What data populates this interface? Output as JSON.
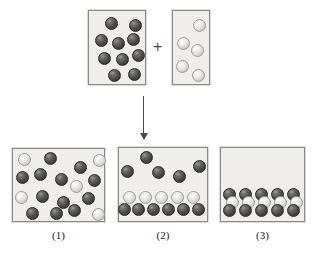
{
  "diagram": {
    "operator": "+",
    "arrow": "down-arrow",
    "colors": {
      "dark_sphere": "#4d4d4b",
      "light_sphere": "#dcdcd8",
      "box_fill": "#efeeec",
      "box_border": "#8a8a88",
      "ink": "#4a4a48"
    }
  },
  "reactants": [
    {
      "id": "reactant-box-a",
      "name": "dark-particle-container",
      "x": 88,
      "y": 10,
      "w": 58,
      "h": 75,
      "dark_count": 10,
      "light_count": 0,
      "spheres": [
        {
          "type": "dark",
          "x": 16,
          "y": 6
        },
        {
          "type": "dark",
          "x": 40,
          "y": 8
        },
        {
          "type": "dark",
          "x": 6,
          "y": 23
        },
        {
          "type": "dark",
          "x": 23,
          "y": 26
        },
        {
          "type": "dark",
          "x": 38,
          "y": 22
        },
        {
          "type": "dark",
          "x": 9,
          "y": 41
        },
        {
          "type": "dark",
          "x": 27,
          "y": 42
        },
        {
          "type": "dark",
          "x": 43,
          "y": 38
        },
        {
          "type": "dark",
          "x": 19,
          "y": 58
        },
        {
          "type": "dark",
          "x": 39,
          "y": 57
        }
      ]
    },
    {
      "id": "reactant-box-b",
      "name": "light-particle-container",
      "x": 172,
      "y": 10,
      "w": 38,
      "h": 75,
      "dark_count": 0,
      "light_count": 5,
      "spheres": [
        {
          "type": "light",
          "x": 20,
          "y": 8
        },
        {
          "type": "light",
          "x": 4,
          "y": 26
        },
        {
          "type": "light",
          "x": 18,
          "y": 33
        },
        {
          "type": "light",
          "x": 3,
          "y": 49
        },
        {
          "type": "light",
          "x": 19,
          "y": 58
        }
      ]
    }
  ],
  "products": [
    {
      "id": "product-box-1",
      "name": "product-container-1",
      "label": "(1)",
      "description": "Dark and light particles randomly mixed throughout the container",
      "x": 12,
      "y": 148,
      "w": 93,
      "h": 74,
      "dark_count": 13,
      "light_count": 5,
      "spheres": [
        {
          "type": "light",
          "x": 5,
          "y": 4
        },
        {
          "type": "dark",
          "x": 31,
          "y": 3
        },
        {
          "type": "dark",
          "x": 61,
          "y": 12
        },
        {
          "type": "light",
          "x": 80,
          "y": 5
        },
        {
          "type": "dark",
          "x": 3,
          "y": 22
        },
        {
          "type": "dark",
          "x": 21,
          "y": 19
        },
        {
          "type": "dark",
          "x": 42,
          "y": 24
        },
        {
          "type": "light",
          "x": 57,
          "y": 31
        },
        {
          "type": "dark",
          "x": 75,
          "y": 25
        },
        {
          "type": "light",
          "x": 2,
          "y": 42
        },
        {
          "type": "dark",
          "x": 23,
          "y": 41
        },
        {
          "type": "dark",
          "x": 44,
          "y": 47
        },
        {
          "type": "dark",
          "x": 69,
          "y": 43
        },
        {
          "type": "dark",
          "x": 13,
          "y": 58
        },
        {
          "type": "dark",
          "x": 37,
          "y": 58
        },
        {
          "type": "dark",
          "x": 55,
          "y": 55
        },
        {
          "type": "light",
          "x": 79,
          "y": 59
        }
      ]
    },
    {
      "id": "product-box-2",
      "name": "product-container-2",
      "label": "(2)",
      "description": "Dark particles above a settled bilayer of light over dark particles",
      "x": 118,
      "y": 147,
      "w": 90,
      "h": 75,
      "dark_count": 11,
      "light_count": 5,
      "top_scatter": [
        {
          "type": "dark",
          "x": 21,
          "y": 3
        },
        {
          "type": "dark",
          "x": 2,
          "y": 17
        },
        {
          "type": "dark",
          "x": 33,
          "y": 18
        },
        {
          "type": "dark",
          "x": 54,
          "y": 22
        },
        {
          "type": "dark",
          "x": 74,
          "y": 12
        }
      ],
      "settled_light_row": [
        {
          "type": "light",
          "x": 4,
          "y": 43
        },
        {
          "type": "light",
          "x": 20,
          "y": 43
        },
        {
          "type": "light",
          "x": 36,
          "y": 43
        },
        {
          "type": "light",
          "x": 52,
          "y": 43
        },
        {
          "type": "light",
          "x": 68,
          "y": 43
        }
      ],
      "settled_dark_row": [
        {
          "type": "dark",
          "x": -1,
          "y": 55
        },
        {
          "type": "dark",
          "x": 13,
          "y": 55
        },
        {
          "type": "dark",
          "x": 28,
          "y": 55
        },
        {
          "type": "dark",
          "x": 43,
          "y": 55
        },
        {
          "type": "dark",
          "x": 58,
          "y": 55
        },
        {
          "type": "dark",
          "x": 73,
          "y": 55
        }
      ]
    },
    {
      "id": "product-box-3",
      "name": "product-container-3",
      "label": "(3)",
      "description": "All particles settled into three stacked layers: dark, light, dark",
      "x": 220,
      "y": 147,
      "w": 85,
      "h": 75,
      "dark_count": 10,
      "light_count": 5,
      "layer_dark_top": [
        {
          "type": "dark",
          "x": 2,
          "y": 40
        },
        {
          "type": "dark",
          "x": 18,
          "y": 40
        },
        {
          "type": "dark",
          "x": 34,
          "y": 40
        },
        {
          "type": "dark",
          "x": 50,
          "y": 40
        },
        {
          "type": "dark",
          "x": 66,
          "y": 40
        }
      ],
      "layer_light_mid": [
        {
          "type": "light",
          "x": 5,
          "y": 48
        },
        {
          "type": "light",
          "x": 21,
          "y": 48
        },
        {
          "type": "light",
          "x": 37,
          "y": 48
        },
        {
          "type": "light",
          "x": 53,
          "y": 48
        },
        {
          "type": "light",
          "x": 69,
          "y": 48
        }
      ],
      "layer_dark_bottom": [
        {
          "type": "dark",
          "x": 2,
          "y": 56
        },
        {
          "type": "dark",
          "x": 18,
          "y": 56
        },
        {
          "type": "dark",
          "x": 34,
          "y": 56
        },
        {
          "type": "dark",
          "x": 50,
          "y": 56
        },
        {
          "type": "dark",
          "x": 66,
          "y": 56
        }
      ]
    }
  ],
  "sphere_size": 13
}
